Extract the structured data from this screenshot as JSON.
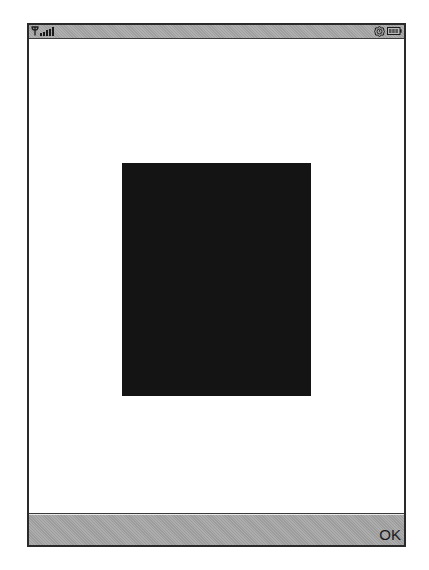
{
  "status_bar": {
    "icons": [
      "antenna-icon",
      "signal-strength-icon",
      "alarm-icon",
      "battery-icon"
    ],
    "signal_bars": 5
  },
  "content": {
    "image_color": "#141414"
  },
  "softkeys": {
    "right_label": "OK"
  },
  "colors": {
    "bar_gray": "#a8a8a8",
    "frame": "#2a2a2a",
    "background": "#ffffff"
  }
}
